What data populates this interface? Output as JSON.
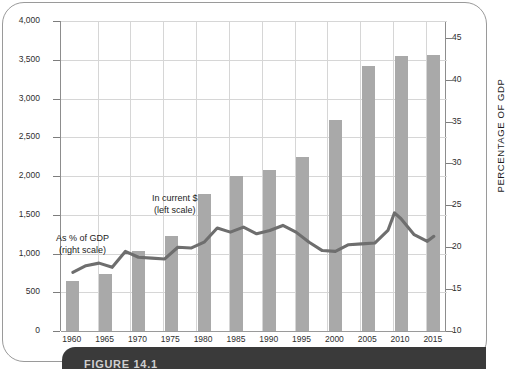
{
  "figure": {
    "caption": "FIGURE 14.1"
  },
  "chart_data": {
    "type": "bar",
    "title": "",
    "subtitle": "",
    "xlabel": "",
    "ylabel": "BILLIONS OF DOLLARS",
    "y2label": "PERCENTAGE OF GDP",
    "grid": true,
    "legend_position": "inline-annotations",
    "ylim": [
      0,
      4000
    ],
    "y2lim": [
      10,
      47
    ],
    "yticks": [
      "0",
      "500",
      "1,000",
      "1,500",
      "2,000",
      "2,500",
      "3,000",
      "3,500",
      "4,000"
    ],
    "ytick_values": [
      0,
      500,
      1000,
      1500,
      2000,
      2500,
      3000,
      3500,
      4000
    ],
    "y2ticks": [
      "10",
      "15",
      "20",
      "25",
      "30",
      "35",
      "40",
      "45"
    ],
    "y2tick_values": [
      10,
      15,
      20,
      25,
      30,
      35,
      40,
      45
    ],
    "categories": [
      "1960",
      "1965",
      "1970",
      "1975",
      "1980",
      "1985",
      "1990",
      "1995",
      "2000",
      "2005",
      "2010",
      "2015"
    ],
    "xtick_labels": [
      "1960",
      "1965",
      "1970",
      "1975",
      "1980",
      "1985",
      "1990",
      "1995",
      "2000",
      "2005",
      "2010",
      "2015"
    ],
    "series": [
      {
        "name": "In current $",
        "scale": "left",
        "type": "bar",
        "color": "#a9a9a9",
        "x": [
          1960,
          1965,
          1970,
          1975,
          1980,
          1985,
          1990,
          1995,
          2000,
          2005,
          2010,
          2015
        ],
        "values": [
          650,
          740,
          1030,
          1230,
          1770,
          2000,
          2080,
          2250,
          2720,
          3420,
          3550,
          3560
        ]
      },
      {
        "name": "As % of GDP",
        "scale": "right",
        "type": "line",
        "color": "#6e6e6e",
        "x": [
          1960,
          1962,
          1964,
          1966,
          1968,
          1970,
          1972,
          1974,
          1976,
          1978,
          1980,
          1982,
          1984,
          1986,
          1988,
          1990,
          1992,
          1994,
          1996,
          1998,
          2000,
          2002,
          2004,
          2006,
          2008,
          2009,
          2010,
          2012,
          2014,
          2015
        ],
        "values": [
          17.0,
          17.8,
          18.1,
          17.6,
          19.5,
          18.8,
          18.7,
          18.6,
          20.0,
          19.9,
          20.6,
          22.3,
          21.8,
          22.4,
          21.6,
          22.0,
          22.6,
          21.8,
          20.6,
          19.6,
          19.5,
          20.3,
          20.4,
          20.5,
          22.0,
          24.1,
          23.4,
          21.5,
          20.7,
          21.3
        ]
      }
    ],
    "annotations": [
      {
        "id": "pct-gdp",
        "line1": "As % of GDP",
        "line2": "(right scale)"
      },
      {
        "id": "current-dollars",
        "line1": "In current $",
        "line2": "(left scale)"
      }
    ]
  }
}
